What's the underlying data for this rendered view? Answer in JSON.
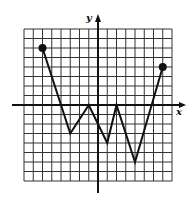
{
  "chart_data": {
    "type": "line",
    "title": "",
    "xlabel": "x",
    "ylabel": "y",
    "xlim": [
      -8,
      8
    ],
    "ylim": [
      -8,
      8
    ],
    "grid": true,
    "grid_step": 1,
    "series": [
      {
        "name": "f",
        "points": [
          [
            -6,
            6
          ],
          [
            -3,
            -3
          ],
          [
            -1,
            0
          ],
          [
            1,
            -4
          ],
          [
            2,
            0
          ],
          [
            4,
            -6
          ],
          [
            7,
            4
          ]
        ],
        "endpoints": "closed-dots"
      }
    ]
  },
  "colors": {
    "ink": "#111111",
    "grid": "#333333",
    "background": "#ffffff"
  },
  "axes": {
    "x_label": "x",
    "y_label": "y"
  }
}
